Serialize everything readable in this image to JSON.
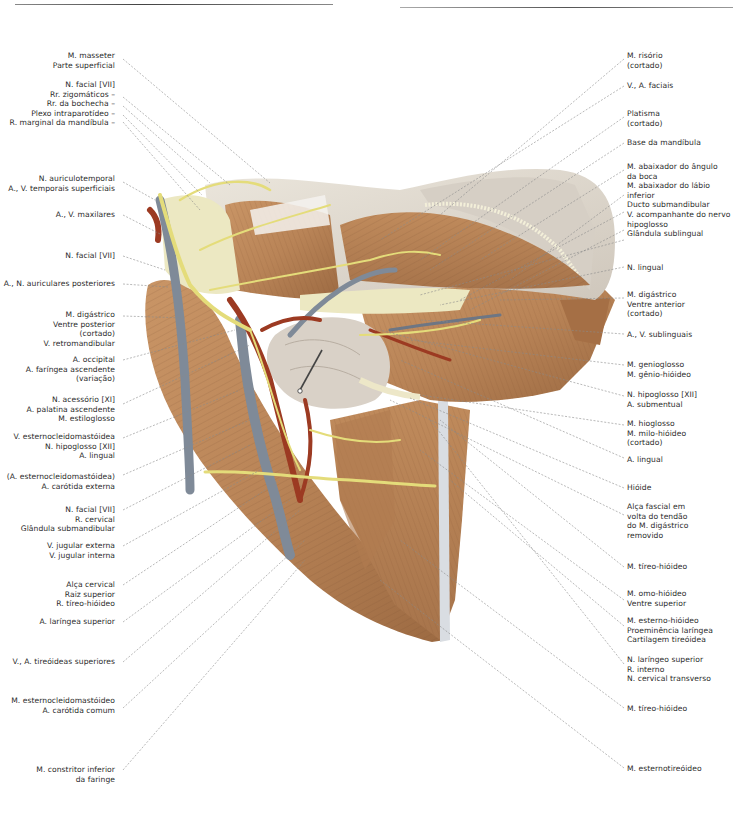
{
  "figure": {
    "type": "anatomical illustration",
    "colors": {
      "muscle": "#b98457",
      "muscle_dark": "#8a5a36",
      "vein": "#7f8a98",
      "artery": "#9c3a22",
      "nerve": "#e4dc7a",
      "gland": "#d8d0c6",
      "skin": "#e6e1d6",
      "fat": "#ece8c2",
      "leader_line": "#8a8a8a"
    }
  },
  "labels_left": [
    {
      "lines": [
        "M. masseter",
        "Parte superficial"
      ]
    },
    {
      "lines": [
        "N. facial [VII]",
        "Rr. zigomáticos –",
        "Rr. da bochecha –",
        "Plexo intraparotídeo –",
        "R. marginal da mandíbula –"
      ]
    },
    {
      "lines": [
        "N. auriculotemporal",
        "A., V. temporais superficiais"
      ]
    },
    {
      "lines": [
        "A., V. maxilares"
      ]
    },
    {
      "lines": [
        "N. facial [VII]"
      ]
    },
    {
      "lines": [
        "A., N. auriculares posteriores"
      ]
    },
    {
      "lines": [
        "M. digástrico",
        "Ventre posterior",
        "(cortado)",
        "V. retromandibular"
      ]
    },
    {
      "lines": [
        "A. occipital",
        "A. faríngea ascendente",
        "(variação)"
      ]
    },
    {
      "lines": [
        "N. acessório [XI]",
        "A. palatina ascendente",
        "M. estiloglosso"
      ]
    },
    {
      "lines": [
        "V. esternocleidomastóidea",
        "N. hipoglosso [XII]",
        "A. lingual"
      ]
    },
    {
      "lines": [
        "(A. esternocleidomastóidea)",
        "A. carótida externa"
      ]
    },
    {
      "lines": [
        "N. facial [VII]",
        "R. cervical",
        "Glândula submandibular"
      ]
    },
    {
      "lines": [
        "V. jugular externa",
        "V. jugular interna"
      ]
    },
    {
      "lines": [
        "Alça cervical",
        "Raiz superior",
        "R. tíreo-hióideo"
      ]
    },
    {
      "lines": [
        "A. laríngea superior"
      ]
    },
    {
      "lines": [
        "V., A. tireóideas superiores"
      ]
    },
    {
      "lines": [
        "M. esternocleidomastóideo",
        "A. carótida comum"
      ]
    },
    {
      "lines": [
        "M. constritor inferior",
        "da faringe"
      ]
    }
  ],
  "labels_right": [
    {
      "lines": [
        "M. risório",
        "(cortado)"
      ]
    },
    {
      "lines": [
        "V., A. faciais"
      ]
    },
    {
      "lines": [
        "Platisma",
        "(cortado)"
      ]
    },
    {
      "lines": [
        "Base da mandíbula"
      ]
    },
    {
      "lines": [
        "M. abaixador do ângulo",
        "da boca",
        "M. abaixador do lábio",
        "inferior",
        "Ducto submandibular",
        "V. acompanhante do nervo",
        "hipoglosso",
        "Glândula sublingual"
      ]
    },
    {
      "lines": [
        "N. lingual"
      ]
    },
    {
      "lines": [
        "M. digástrico",
        "Ventre anterior",
        "(cortado)"
      ]
    },
    {
      "lines": [
        "A., V. sublinguais"
      ]
    },
    {
      "lines": [
        "M. genioglosso",
        "M. gênio-hióideo"
      ]
    },
    {
      "lines": [
        "N. hipoglosso [XII]",
        "A. submentual"
      ]
    },
    {
      "lines": [
        "M. hioglosso",
        "M. milo-hióideo",
        "(cortado)"
      ]
    },
    {
      "lines": [
        "A. lingual"
      ]
    },
    {
      "lines": [
        "Hióide"
      ]
    },
    {
      "lines": [
        "Alça fascial em",
        "volta do tendão",
        "do M. digástrico",
        "removido"
      ]
    },
    {
      "lines": [
        "M. tíreo-hióideo"
      ]
    },
    {
      "lines": [
        "M. omo-hióideo",
        "Ventre superior"
      ]
    },
    {
      "lines": [
        "M. esterno-hióideo",
        "Proeminência laríngea",
        "Cartilagem tireóidea"
      ]
    },
    {
      "lines": [
        "N. laríngeo superior",
        "R. interno",
        "N. cervical transverso"
      ]
    },
    {
      "lines": [
        "M. tíreo-hióideo"
      ]
    },
    {
      "lines": [
        "M. esternotireóideo"
      ]
    }
  ]
}
